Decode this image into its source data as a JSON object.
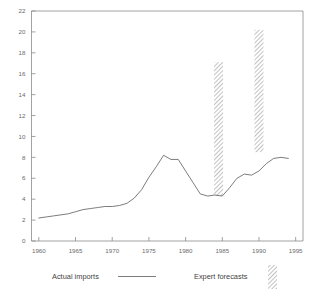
{
  "chart_data": {
    "type": "line",
    "title": "",
    "subtitle": "",
    "xlabel": "",
    "ylabel": "",
    "xlim": [
      1959,
      1996
    ],
    "ylim": [
      0,
      22
    ],
    "grid": false,
    "legend_position": "bottom",
    "x_ticks": [
      1960,
      1965,
      1970,
      1975,
      1980,
      1985,
      1990,
      1995
    ],
    "x_tick_labels": [
      "1960",
      "1965",
      "1970",
      "1975",
      "1980",
      "1985",
      "1990",
      "1995"
    ],
    "y_ticks": [
      0,
      2,
      4,
      6,
      8,
      10,
      12,
      14,
      16,
      18,
      20,
      22
    ],
    "y_tick_labels": [
      "0",
      "2",
      "4",
      "6",
      "8",
      "10",
      "12",
      "14",
      "16",
      "18",
      "20",
      "22"
    ],
    "series": [
      {
        "name": "Actual imports",
        "type": "line",
        "x": [
          1960,
          1961,
          1962,
          1963,
          1964,
          1965,
          1966,
          1967,
          1968,
          1969,
          1970,
          1971,
          1972,
          1973,
          1974,
          1975,
          1976,
          1977,
          1978,
          1979,
          1980,
          1981,
          1982,
          1983,
          1984,
          1985,
          1986,
          1987,
          1988,
          1989,
          1990,
          1991,
          1992,
          1993,
          1994
        ],
        "values": [
          2.2,
          2.3,
          2.4,
          2.5,
          2.6,
          2.8,
          3.0,
          3.1,
          3.2,
          3.3,
          3.3,
          3.4,
          3.6,
          4.1,
          4.9,
          6.1,
          7.1,
          8.2,
          7.8,
          7.8,
          6.7,
          5.6,
          4.5,
          4.3,
          4.4,
          4.3,
          5.1,
          6.0,
          6.4,
          6.3,
          6.7,
          7.4,
          7.9,
          8.0,
          7.9
        ]
      },
      {
        "name": "Expert forecasts",
        "type": "range-bar",
        "bars": [
          {
            "x": 1984.5,
            "low": 4.3,
            "high": 17.1
          },
          {
            "x": 1990.0,
            "low": 8.5,
            "high": 20.2
          }
        ]
      }
    ],
    "legend": [
      {
        "label": "Actual imports",
        "marker": "line"
      },
      {
        "label": "Expert forecasts",
        "marker": "hatched-bar"
      }
    ],
    "colors": {
      "line": "#6d6d6d",
      "axis": "#8a8a8a",
      "text": "#555555",
      "hatch": "#9a9a9a",
      "background": "#ffffff"
    }
  }
}
